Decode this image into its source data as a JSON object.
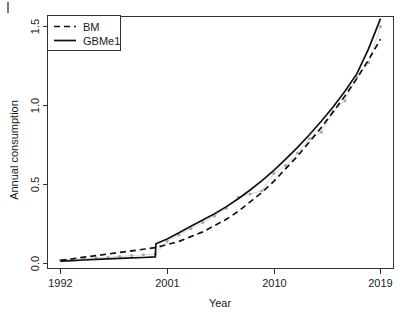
{
  "chart_data": {
    "type": "line",
    "title": "",
    "xlabel": "Year",
    "ylabel": "Annual consumption",
    "xlim": [
      1992,
      2019
    ],
    "ylim": [
      0.0,
      1.6
    ],
    "xticks": [
      1992,
      2001,
      2010,
      2019
    ],
    "xticklabels": [
      "1992",
      "2001",
      "2010",
      "2019"
    ],
    "yticks": [
      0.0,
      0.5,
      1.0,
      1.5
    ],
    "yticklabels": [
      "0.0",
      "0.5",
      "1.0",
      "1.5"
    ],
    "grid": false,
    "legend_position": "top-left",
    "legend_entries": [
      {
        "label": "BM",
        "style": "dashed"
      },
      {
        "label": "GBMe1",
        "style": "solid"
      }
    ],
    "series": [
      {
        "name": "BM",
        "style": "dashed",
        "x": [
          1992,
          1993,
          1994,
          1995,
          1996,
          1997,
          1998,
          1999,
          2000,
          2001,
          2002,
          2003,
          2004,
          2005,
          2006,
          2007,
          2008,
          2009,
          2010,
          2011,
          2012,
          2013,
          2014,
          2015,
          2016,
          2017,
          2018,
          2019
        ],
        "values": [
          0.02,
          0.03,
          0.04,
          0.05,
          0.06,
          0.07,
          0.08,
          0.09,
          0.1,
          0.12,
          0.14,
          0.17,
          0.2,
          0.24,
          0.28,
          0.33,
          0.39,
          0.45,
          0.52,
          0.6,
          0.68,
          0.77,
          0.86,
          0.96,
          1.06,
          1.17,
          1.29,
          1.42
        ]
      },
      {
        "name": "GBMe1",
        "style": "solid",
        "x": [
          1992,
          1993,
          1994,
          1995,
          1996,
          1997,
          1998,
          1999,
          2000,
          2000.05,
          2001,
          2002,
          2003,
          2004,
          2005,
          2006,
          2007,
          2008,
          2009,
          2010,
          2011,
          2012,
          2013,
          2014,
          2015,
          2016,
          2017,
          2018,
          2019
        ],
        "values": [
          0.015,
          0.018,
          0.022,
          0.026,
          0.029,
          0.032,
          0.035,
          0.038,
          0.042,
          0.125,
          0.155,
          0.195,
          0.235,
          0.275,
          0.315,
          0.36,
          0.41,
          0.465,
          0.525,
          0.59,
          0.66,
          0.735,
          0.815,
          0.9,
          0.99,
          1.09,
          1.2,
          1.36,
          1.55
        ]
      }
    ],
    "observed": {
      "name": "observed",
      "marker": "point",
      "color": "#a6a6a6",
      "x": [
        1992,
        1993,
        1994,
        1995,
        1996,
        1997,
        1998,
        1999,
        2000,
        2001,
        2002,
        2003,
        2004,
        2005,
        2006,
        2007,
        2008,
        2009,
        2010,
        2011,
        2012,
        2013,
        2014,
        2015,
        2016,
        2017,
        2018,
        2019
      ],
      "values": [
        0.02,
        0.025,
        0.03,
        0.035,
        0.04,
        0.045,
        0.05,
        0.055,
        0.06,
        0.14,
        0.18,
        0.22,
        0.26,
        0.3,
        0.35,
        0.42,
        0.44,
        0.46,
        0.57,
        0.62,
        0.7,
        0.79,
        0.83,
        0.96,
        1.03,
        1.18,
        1.27,
        1.5
      ]
    }
  },
  "axes": {
    "y_label": "Annual consumption",
    "x_label": "Year",
    "x_tick_labels": [
      "1992",
      "2001",
      "2010",
      "2019"
    ],
    "y_tick_labels": [
      "0.0",
      "0.5",
      "1.0",
      "1.5"
    ]
  },
  "legend": {
    "items": [
      {
        "label": "BM"
      },
      {
        "label": "GBMe1"
      }
    ]
  },
  "colors": {
    "line": "#111111",
    "observed": "#a6a6a6",
    "axis": "#333333",
    "background": "#ffffff"
  }
}
